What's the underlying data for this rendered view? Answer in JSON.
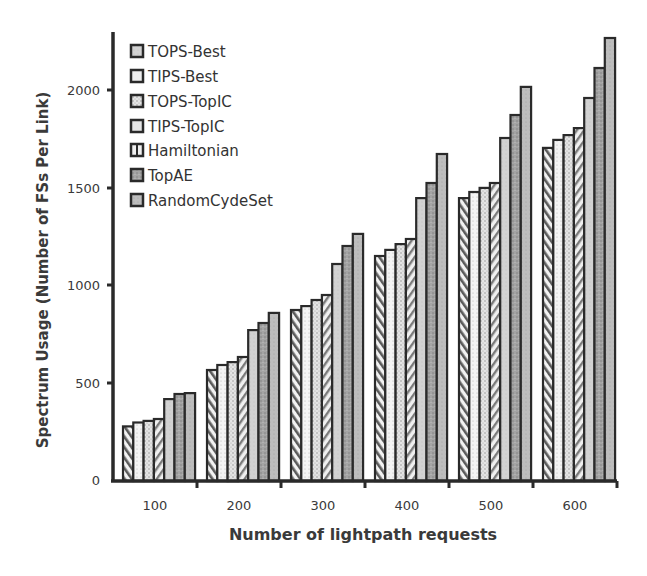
{
  "chart_data": {
    "type": "bar",
    "title": "",
    "xlabel": "Number of lightpath requests",
    "ylabel": "Spectrum Usage (Number of FSs Per Link)",
    "categories": [
      "100",
      "200",
      "300",
      "400",
      "500",
      "600"
    ],
    "ylim": [
      0,
      2300
    ],
    "yticks": [
      0,
      500,
      1000,
      1500,
      2000
    ],
    "grid": false,
    "legend_position": "upper-left-inside",
    "series": [
      {
        "name": "TOPS-Best",
        "pattern": "hatch-forward",
        "color": "#d0d0d0",
        "values": [
          280,
          569,
          877,
          1154,
          1451,
          1708
        ]
      },
      {
        "name": "TIPS-Best",
        "pattern": "light-dots",
        "color": "#ececec",
        "values": [
          300,
          595,
          897,
          1185,
          1482,
          1749
        ]
      },
      {
        "name": "TOPS-TopIC",
        "pattern": "gray-dots",
        "color": "#dcdcdc",
        "values": [
          308,
          610,
          928,
          1215,
          1503,
          1774
        ]
      },
      {
        "name": "TIPS-TopIC",
        "pattern": "hatch-back",
        "color": "#d8d8d8",
        "values": [
          318,
          636,
          954,
          1241,
          1528,
          1810
        ]
      },
      {
        "name": "Hamiltonian",
        "pattern": "light-gray",
        "color": "#cfcfcf",
        "values": [
          420,
          774,
          1113,
          1451,
          1759,
          1964
        ]
      },
      {
        "name": "TopAE",
        "pattern": "dark-noise",
        "color": "#a9a9a9",
        "values": [
          446,
          810,
          1205,
          1528,
          1877,
          2118
        ]
      },
      {
        "name": "RandomCydeSet",
        "pattern": "mid-gray",
        "color": "#bcbcbc",
        "values": [
          451,
          862,
          1267,
          1677,
          2021,
          2272
        ]
      }
    ]
  },
  "axes": {
    "ylabel": "Spectrum Usage (Number of FSs Per Link)",
    "xlabel": "Number of lightpath requests",
    "yticks": [
      "0",
      "500",
      "1000",
      "1500",
      "2000"
    ],
    "xticks": [
      "100",
      "200",
      "300",
      "400",
      "500",
      "600"
    ]
  },
  "legend": {
    "items": [
      "TOPS-Best",
      "TIPS-Best",
      "TOPS-TopIC",
      "TIPS-TopIC",
      "Hamiltonian",
      "TopAE",
      "RandomCydeSet"
    ]
  }
}
